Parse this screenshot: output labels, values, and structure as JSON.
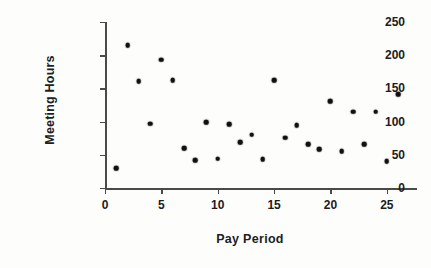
{
  "chart_data": {
    "type": "scatter",
    "title": "",
    "xlabel": "Pay Period",
    "ylabel": "Meeting Hours",
    "xlim": [
      0,
      27.5
    ],
    "ylim": [
      0,
      250
    ],
    "xticks": [
      0,
      5,
      10,
      15,
      20,
      25
    ],
    "xticklabels": [
      "0",
      "5",
      "10",
      "15",
      "20",
      "25"
    ],
    "yticks": [
      0,
      50,
      100,
      150,
      200,
      250
    ],
    "yticklabels": [
      "0",
      "50",
      "100",
      "150",
      "200",
      "250"
    ],
    "grid": false,
    "legend": null,
    "marker": "filled-circle",
    "marker_color": "#111111",
    "x": [
      1,
      2,
      3,
      4,
      5,
      6,
      7,
      8,
      9,
      10,
      11,
      12,
      13,
      14,
      15,
      16,
      17,
      18,
      19,
      20,
      21,
      22,
      23,
      24,
      25,
      26
    ],
    "y": [
      30,
      215,
      161,
      97,
      193,
      162,
      60,
      42,
      99,
      44,
      96,
      69,
      80,
      43,
      162,
      76,
      95,
      66,
      58,
      131,
      55,
      115,
      66,
      115,
      40,
      141
    ],
    "points": [
      {
        "x": 1,
        "y": 30
      },
      {
        "x": 2,
        "y": 215
      },
      {
        "x": 3,
        "y": 161
      },
      {
        "x": 4,
        "y": 97
      },
      {
        "x": 5,
        "y": 193
      },
      {
        "x": 6,
        "y": 162
      },
      {
        "x": 7,
        "y": 60
      },
      {
        "x": 8,
        "y": 42
      },
      {
        "x": 9,
        "y": 99
      },
      {
        "x": 10,
        "y": 44
      },
      {
        "x": 11,
        "y": 96
      },
      {
        "x": 12,
        "y": 69
      },
      {
        "x": 13,
        "y": 80
      },
      {
        "x": 14,
        "y": 43
      },
      {
        "x": 15,
        "y": 162
      },
      {
        "x": 16,
        "y": 76
      },
      {
        "x": 17,
        "y": 95
      },
      {
        "x": 18,
        "y": 66
      },
      {
        "x": 19,
        "y": 58
      },
      {
        "x": 20,
        "y": 131
      },
      {
        "x": 21,
        "y": 55
      },
      {
        "x": 22,
        "y": 115
      },
      {
        "x": 23,
        "y": 66
      },
      {
        "x": 24,
        "y": 115
      },
      {
        "x": 25,
        "y": 40
      },
      {
        "x": 26,
        "y": 141
      }
    ]
  },
  "colors": {
    "marker": "#111111",
    "axis": "#4a4a4a",
    "text": "#1c1c1c",
    "background": "#fdfdfc"
  }
}
